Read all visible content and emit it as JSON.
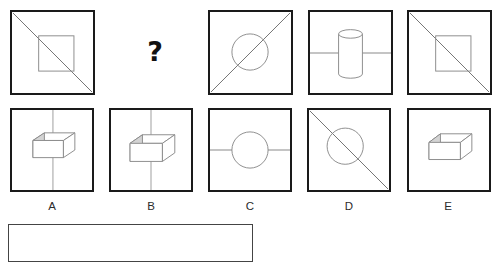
{
  "puzzle": {
    "type": "visual-analogy-matrix",
    "question_mark": "?",
    "cropped_header_text": "",
    "top_row": {
      "name": "stimulus-row",
      "cells": [
        {
          "id": "top-1",
          "name": "stimulus-cell-1",
          "shapes": [
            "square-outline",
            "diagonal-line-tl-br"
          ],
          "description": "Square with descending diagonal and inner square"
        },
        {
          "id": "top-gap",
          "name": "stimulus-cell-missing",
          "shapes": [
            "question-mark"
          ],
          "description": "Missing cell marked with a question mark"
        },
        {
          "id": "top-2",
          "name": "stimulus-cell-2",
          "shapes": [
            "circle-outline",
            "diagonal-line-bl-tr"
          ],
          "description": "Circle with ascending diagonal"
        },
        {
          "id": "top-3",
          "name": "stimulus-cell-3",
          "shapes": [
            "cylinder-3d",
            "horizontal-line"
          ],
          "description": "Cylinder with horizontal line"
        },
        {
          "id": "top-4",
          "name": "stimulus-cell-4",
          "shapes": [
            "square-outline",
            "diagonal-line-tl-br"
          ],
          "description": "Square with descending diagonal and inner square"
        }
      ]
    },
    "options_row": {
      "name": "answer-options-row",
      "options": [
        {
          "label": "A",
          "name": "option-a",
          "shapes": [
            "cuboid-3d",
            "vertical-line"
          ],
          "description": "3D box with vertical line through it"
        },
        {
          "label": "B",
          "name": "option-b",
          "shapes": [
            "cuboid-3d",
            "vertical-line"
          ],
          "description": "3D box centered on vertical line"
        },
        {
          "label": "C",
          "name": "option-c",
          "shapes": [
            "circle-outline",
            "horizontal-line"
          ],
          "description": "Circle with horizontal line through it"
        },
        {
          "label": "D",
          "name": "option-d",
          "shapes": [
            "circle-outline",
            "diagonal-line-tl-br"
          ],
          "description": "Circle with descending diagonal"
        },
        {
          "label": "E",
          "name": "option-e",
          "shapes": [
            "cuboid-3d"
          ],
          "description": "3D box only"
        }
      ]
    },
    "answer_field": {
      "name": "answer-input",
      "value": "",
      "placeholder": ""
    }
  },
  "colors": {
    "panel_border": "#1a1a1a",
    "figure_stroke": "#7d7d7d",
    "figure_dark_stroke": "#6a6a6a",
    "shade_fill": "#d4d4d4",
    "answer_border": "#444444",
    "text": "#2b2b2b"
  }
}
